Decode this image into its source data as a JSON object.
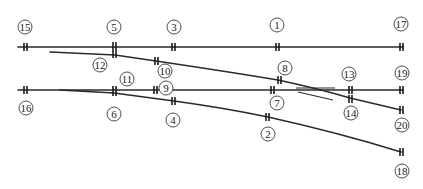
{
  "colors": {
    "line": "#2a2a2a",
    "background": "#ffffff"
  },
  "sections": [
    {
      "id": "15",
      "label": "15"
    },
    {
      "id": "5",
      "label": "5"
    },
    {
      "id": "3",
      "label": "3"
    },
    {
      "id": "1",
      "label": "1"
    },
    {
      "id": "17",
      "label": "17"
    },
    {
      "id": "12",
      "label": "12"
    },
    {
      "id": "10",
      "label": "10"
    },
    {
      "id": "8",
      "label": "8"
    },
    {
      "id": "13",
      "label": "13"
    },
    {
      "id": "19",
      "label": "19"
    },
    {
      "id": "11",
      "label": "11"
    },
    {
      "id": "9",
      "label": "9"
    },
    {
      "id": "16",
      "label": "16"
    },
    {
      "id": "6",
      "label": "6"
    },
    {
      "id": "4",
      "label": "4"
    },
    {
      "id": "7",
      "label": "7"
    },
    {
      "id": "14",
      "label": "14"
    },
    {
      "id": "20",
      "label": "20"
    },
    {
      "id": "2",
      "label": "2"
    },
    {
      "id": "18",
      "label": "18"
    }
  ]
}
